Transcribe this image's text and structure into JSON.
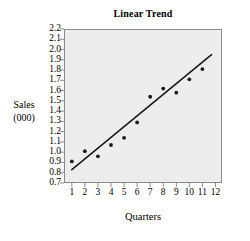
{
  "chart_data": {
    "type": "scatter",
    "title": "Linear Trend",
    "xlabel": "Quarters",
    "ylabel": "Sales",
    "ylabel_line2": "(000)",
    "x": [
      1,
      2,
      3,
      4,
      5,
      6,
      7,
      8,
      9,
      10,
      11
    ],
    "values": [
      0.91,
      1.01,
      0.96,
      1.07,
      1.14,
      1.29,
      1.54,
      1.62,
      1.58,
      1.71,
      1.81
    ],
    "series": [
      {
        "name": "Sales",
        "values": [
          0.91,
          1.01,
          0.96,
          1.07,
          1.14,
          1.29,
          1.54,
          1.62,
          1.58,
          1.71,
          1.81
        ]
      }
    ],
    "trendline": {
      "name": "Linear Trend",
      "x_start": 1.0,
      "y_start": 0.83,
      "x_end": 11.7,
      "y_end": 1.95
    },
    "xlim": [
      0.4,
      12.5
    ],
    "ylim": [
      0.7,
      2.2
    ],
    "x_ticks": [
      1,
      2,
      3,
      4,
      5,
      6,
      7,
      8,
      9,
      10,
      11,
      12
    ],
    "x_tick_labels": [
      "1",
      "2",
      "3",
      "4",
      "5",
      "6",
      "7",
      "8",
      "9",
      "10",
      "11",
      "12"
    ],
    "y_ticks": [
      0.7,
      0.8,
      0.9,
      1.0,
      1.1,
      1.2,
      1.3,
      1.4,
      1.5,
      1.6,
      1.7,
      1.8,
      1.9,
      2.0,
      2.1,
      2.2
    ],
    "y_tick_labels": [
      "0.7",
      "0.8",
      "0.9",
      "1.0",
      "1.1",
      "1.2",
      "1.3",
      "1.4",
      "1.5",
      "1.6",
      "1.7",
      "1.8",
      "1.9",
      "2.0",
      "2.1",
      "2.2"
    ],
    "grid": false,
    "legend": null,
    "plot_background": "#ededed",
    "marker_color": "#1a1a1a",
    "line_color": "#1a1a1a",
    "axis_color": "#8a8a8a"
  }
}
